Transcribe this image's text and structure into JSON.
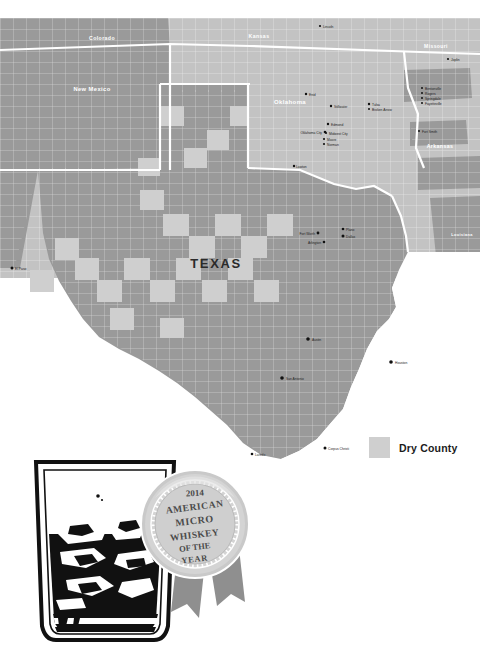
{
  "page": {
    "background": "#ffffff"
  },
  "map": {
    "focus_state": "TEXAS",
    "states": [
      {
        "name": "Colorado",
        "label_x": 102,
        "label_y": 22,
        "size": 5.2,
        "tone": "light"
      },
      {
        "name": "Kansas",
        "label_x": 259,
        "label_y": 20,
        "size": 5.2,
        "tone": "light"
      },
      {
        "name": "Missouri",
        "label_x": 432,
        "label_y": 28,
        "size": 5.2,
        "tone": "light"
      },
      {
        "name": "New Mexico",
        "label_x": 90,
        "label_y": 72,
        "size": 5.6,
        "tone": "light"
      },
      {
        "name": "Oklahoma",
        "label_x": 285,
        "label_y": 84,
        "size": 5.8,
        "tone": "light"
      },
      {
        "name": "Arkansas",
        "label_x": 434,
        "label_y": 129,
        "size": 5.2,
        "tone": "light"
      },
      {
        "name": "Louisiana",
        "label_x": 459,
        "label_y": 218,
        "size": 4.0,
        "tone": "light"
      }
    ],
    "cities": [
      {
        "name": "Lincoln",
        "x": 322,
        "y": 10,
        "anchor": "start"
      },
      {
        "name": "Joplin",
        "x": 450,
        "y": 43,
        "anchor": "start"
      },
      {
        "name": "Bentonville",
        "x": 424,
        "y": 72,
        "anchor": "start"
      },
      {
        "name": "Rogers",
        "x": 424,
        "y": 77,
        "anchor": "start"
      },
      {
        "name": "Springdale",
        "x": 424,
        "y": 82,
        "anchor": "start"
      },
      {
        "name": "Fayetteville",
        "x": 424,
        "y": 87,
        "anchor": "start"
      },
      {
        "name": "Fort Smith",
        "x": 421,
        "y": 115,
        "anchor": "start"
      },
      {
        "name": "Enid",
        "x": 308,
        "y": 78,
        "anchor": "start"
      },
      {
        "name": "Stillwater",
        "x": 333,
        "y": 90,
        "anchor": "start"
      },
      {
        "name": "Tulsa",
        "x": 371,
        "y": 88,
        "anchor": "start"
      },
      {
        "name": "Broken Arrow",
        "x": 371,
        "y": 93,
        "anchor": "start"
      },
      {
        "name": "Edmond",
        "x": 330,
        "y": 108,
        "anchor": "start"
      },
      {
        "name": "Oklahoma City",
        "x": 323,
        "y": 116,
        "anchor": "end"
      },
      {
        "name": "Midwest City",
        "x": 328,
        "y": 117,
        "anchor": "start"
      },
      {
        "name": "Moore",
        "x": 326,
        "y": 123,
        "anchor": "start"
      },
      {
        "name": "Norman",
        "x": 326,
        "y": 128,
        "anchor": "start"
      },
      {
        "name": "Lawton",
        "x": 296,
        "y": 150,
        "anchor": "start"
      },
      {
        "name": "Fort Worth",
        "x": 316,
        "y": 217,
        "anchor": "end"
      },
      {
        "name": "Arlington",
        "x": 322,
        "y": 226,
        "anchor": "end"
      },
      {
        "name": "Plano",
        "x": 345,
        "y": 213,
        "anchor": "start"
      },
      {
        "name": "Dallas",
        "x": 345,
        "y": 220,
        "anchor": "start"
      },
      {
        "name": "El Paso",
        "x": 14,
        "y": 252,
        "anchor": "start"
      },
      {
        "name": "Austin",
        "x": 310,
        "y": 323,
        "anchor": "start"
      },
      {
        "name": "San Antonio",
        "x": 284,
        "y": 362,
        "anchor": "start"
      },
      {
        "name": "Houston",
        "x": 393,
        "y": 346,
        "anchor": "start"
      },
      {
        "name": "Corpus Christi",
        "x": 327,
        "y": 432,
        "anchor": "start"
      },
      {
        "name": "Laredo",
        "x": 254,
        "y": 438,
        "anchor": "start"
      }
    ],
    "colors": {
      "state_fill": "#9a9a9a",
      "neighbor_fill": "#c3c3c3",
      "dry_county_fill": "#cfcfcf",
      "county_line": "#d9d9d9",
      "state_border": "#ffffff",
      "water": "#ffffff",
      "city_dot": "#111111"
    }
  },
  "legend": {
    "label": "Dry County",
    "swatch_color": "#cfcfcf"
  },
  "medal": {
    "year": "2014",
    "line1": "AMERICAN",
    "line2": "MICRO",
    "line3": "WHISKEY",
    "line4": "OF THE",
    "line5": "YEAR",
    "body_color": "#c9c9c9",
    "ribbon_color": "#8f8f8f"
  },
  "glass": {
    "type": "rocks-glass",
    "contents": "whiskey-with-ice",
    "ink_color": "#111111"
  }
}
